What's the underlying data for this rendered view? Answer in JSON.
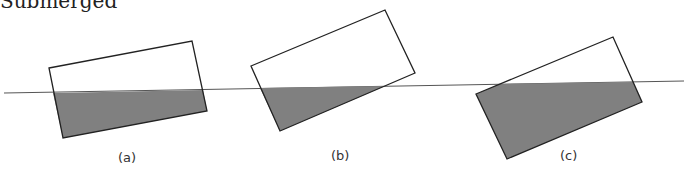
{
  "header": {
    "clipped_text": "Submerged"
  },
  "colors": {
    "fill": "#808080",
    "stroke": "#222222",
    "waterline": "#555555",
    "background": "#ffffff"
  },
  "waterline": {
    "x1": 4,
    "y1": 93,
    "x2": 684,
    "y2": 81
  },
  "panels": [
    {
      "label": "(a)",
      "label_pos": [
        118,
        162
      ],
      "rect": [
        [
          49,
          68
        ],
        [
          192,
          41
        ],
        [
          207,
          111
        ],
        [
          63,
          138
        ]
      ],
      "submerged": [
        [
          53,
          93
        ],
        [
          203,
          90
        ],
        [
          207,
          111
        ],
        [
          63,
          138
        ]
      ]
    },
    {
      "label": "(b)",
      "label_pos": [
        331,
        160
      ],
      "rect": [
        [
          251,
          66
        ],
        [
          385,
          10
        ],
        [
          415,
          73
        ],
        [
          280,
          131
        ]
      ],
      "submerged": [
        [
          260,
          88
        ],
        [
          385,
          86
        ],
        [
          280,
          131
        ]
      ]
    },
    {
      "label": "(c)",
      "label_pos": [
        560,
        160
      ],
      "rect": [
        [
          476,
          94
        ],
        [
          613,
          37
        ],
        [
          642,
          102
        ],
        [
          507,
          159
        ]
      ],
      "submerged": [
        [
          476,
          94
        ],
        [
          500,
          84
        ],
        [
          633,
          82
        ],
        [
          642,
          102
        ],
        [
          507,
          159
        ]
      ]
    }
  ]
}
